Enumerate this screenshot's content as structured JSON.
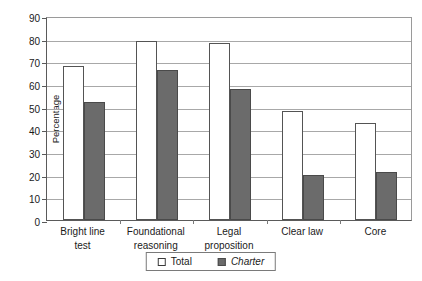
{
  "chart_data": {
    "type": "bar",
    "title": "",
    "xlabel": "",
    "ylabel": "Percentage",
    "ylim": [
      0,
      90
    ],
    "ytick_step": 10,
    "yticks": [
      90,
      80,
      70,
      60,
      50,
      40,
      30,
      20,
      10,
      0
    ],
    "grid": true,
    "legend_position": "bottom-center",
    "categories": [
      "Bright line test",
      "Foundational reasoning",
      "Legal proposition",
      "Clear law",
      "Core"
    ],
    "category_lines": [
      [
        "Bright line",
        "test"
      ],
      [
        "Foundational",
        "reasoning"
      ],
      [
        "Legal",
        "proposition"
      ],
      [
        "Clear law"
      ],
      [
        "Core"
      ]
    ],
    "series": [
      {
        "name": "Total",
        "style": "outlined",
        "color": "#ffffff",
        "edge_color": "#545454",
        "values": [
          68,
          79,
          78,
          48,
          43
        ]
      },
      {
        "name": "Charter",
        "style": "filled-italic",
        "color": "#6b6b6b",
        "edge_color": "#4a4a4a",
        "values": [
          52,
          66,
          58,
          20,
          21
        ]
      }
    ]
  },
  "legend": {
    "items": [
      {
        "label": "Total",
        "swatch": "total-swatch-icon"
      },
      {
        "label": "Charter",
        "swatch": "charter-swatch-icon"
      }
    ]
  },
  "colors": {
    "charter_fill": "#6b6b6b",
    "total_fill": "#ffffff",
    "gridline": "#a8a8a8",
    "axis": "#5a5a5a",
    "text": "#1a1a1a"
  }
}
